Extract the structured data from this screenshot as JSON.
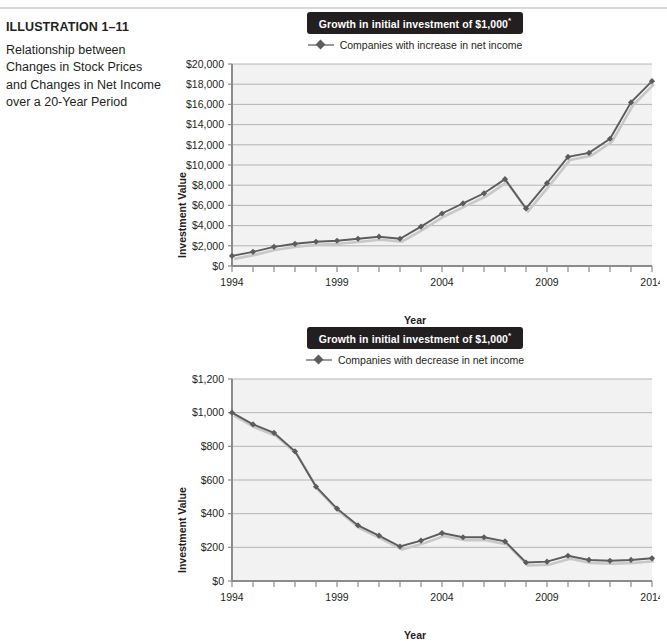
{
  "caption": {
    "title": "ILLUSTRATION 1–11",
    "body": "Relationship between Changes in Stock Prices and Changes in Net Income over a 20-Year Period"
  },
  "chart_data": [
    {
      "id": "chart1",
      "type": "line",
      "title": "Growth in initial investment of $1,000",
      "title_superscript": "*",
      "legend": [
        "Companies with increase in net income"
      ],
      "legend_position": "top-center",
      "xlabel": "Year",
      "ylabel": "Investment Value",
      "grid": true,
      "xlim": [
        1994,
        2014
      ],
      "ylim": [
        0,
        20000
      ],
      "ytick_labels": [
        "$0",
        "$2,000",
        "$4,000",
        "$6,000",
        "$8,000",
        "$10,000",
        "$12,000",
        "$14,000",
        "$16,000",
        "$18,000",
        "$20,000"
      ],
      "ytick_values": [
        0,
        2000,
        4000,
        6000,
        8000,
        10000,
        12000,
        14000,
        16000,
        18000,
        20000
      ],
      "xtick_labels": [
        "1994",
        "1999",
        "2004",
        "2009",
        "2014"
      ],
      "xtick_values": [
        1994,
        1999,
        2004,
        2009,
        2014
      ],
      "x": [
        1994,
        1995,
        1996,
        1997,
        1998,
        1999,
        2000,
        2001,
        2002,
        2003,
        2004,
        2005,
        2006,
        2007,
        2008,
        2009,
        2010,
        2011,
        2012,
        2013,
        2014
      ],
      "series": [
        {
          "name": "Companies with increase in net income",
          "color": "#5c5c5c",
          "marker": "diamond",
          "values": [
            1000,
            1400,
            1900,
            2200,
            2400,
            2500,
            2700,
            2900,
            2700,
            3900,
            5200,
            6200,
            7200,
            8600,
            5700,
            8200,
            10800,
            11200,
            12600,
            16200,
            18300
          ]
        }
      ]
    },
    {
      "id": "chart2",
      "type": "line",
      "title": "Growth in initial investment of $1,000",
      "title_superscript": "*",
      "legend": [
        "Companies with decrease in net income"
      ],
      "legend_position": "top-center",
      "xlabel": "Year",
      "ylabel": "Investment Value",
      "grid": true,
      "xlim": [
        1994,
        2014
      ],
      "ylim": [
        0,
        1200
      ],
      "ytick_labels": [
        "$0",
        "$200",
        "$400",
        "$600",
        "$800",
        "$1,000",
        "$1,200"
      ],
      "ytick_values": [
        0,
        200,
        400,
        600,
        800,
        1000,
        1200
      ],
      "xtick_labels": [
        "1994",
        "1999",
        "2004",
        "2009",
        "2014"
      ],
      "xtick_values": [
        1994,
        1999,
        2004,
        2009,
        2014
      ],
      "x": [
        1994,
        1995,
        1996,
        1997,
        1998,
        1999,
        2000,
        2001,
        2002,
        2003,
        2004,
        2005,
        2006,
        2007,
        2008,
        2009,
        2010,
        2011,
        2012,
        2013,
        2014
      ],
      "series": [
        {
          "name": "Companies with decrease in net income",
          "color": "#5c5c5c",
          "marker": "diamond",
          "values": [
            1000,
            930,
            880,
            770,
            560,
            430,
            330,
            270,
            205,
            240,
            285,
            260,
            260,
            235,
            110,
            115,
            150,
            125,
            120,
            125,
            135
          ]
        }
      ]
    }
  ]
}
